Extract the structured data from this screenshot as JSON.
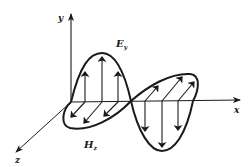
{
  "diagram": {
    "axes": {
      "x_label": "x",
      "y_label": "y",
      "z_label": "z"
    },
    "fields": {
      "electric": {
        "symbol": "E",
        "subscript": "y",
        "direction": "y"
      },
      "magnetic": {
        "symbol": "H",
        "subscript": "z",
        "direction": "z"
      }
    },
    "colors": {
      "line": "#1a1a1a",
      "background": "#ffffff"
    }
  }
}
